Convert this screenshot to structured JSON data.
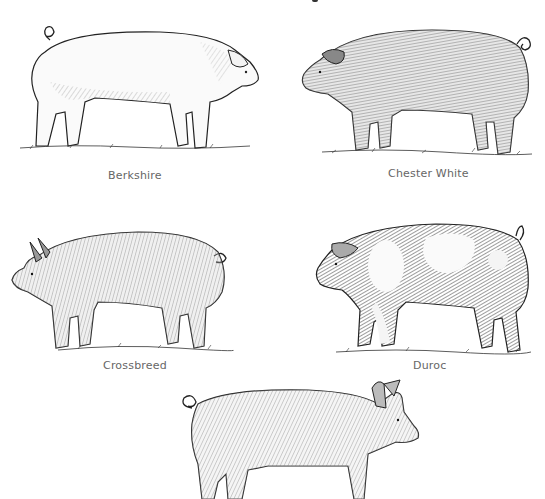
{
  "figure": {
    "ink_color": "#222222",
    "label_color": "#666666",
    "panels": [
      {
        "id": "top-left",
        "label": "Berkshire",
        "pig_tone": "light",
        "facing": "right"
      },
      {
        "id": "top-right",
        "label": "Chester White",
        "pig_tone": "dark-hatched",
        "facing": "left"
      },
      {
        "id": "middle-left",
        "label": "Crossbreed",
        "pig_tone": "medium-hatched",
        "facing": "left"
      },
      {
        "id": "middle-right",
        "label": "Duroc",
        "pig_tone": "spotted",
        "facing": "left"
      },
      {
        "id": "bottom-center",
        "label": "",
        "pig_tone": "medium-hatched",
        "facing": "right"
      }
    ]
  }
}
